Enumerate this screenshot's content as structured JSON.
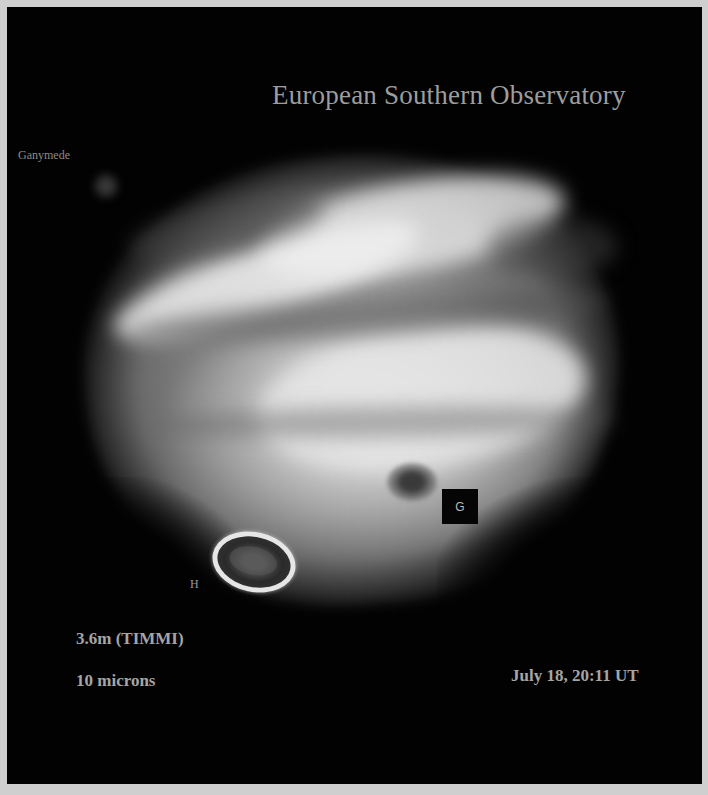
{
  "image": {
    "title": "European Southern Observatory",
    "subject": "Jupiter (infrared)",
    "labels": {
      "moon": "Ganymede",
      "impact_g": "G",
      "impact_h": "H"
    },
    "instrument": "3.6m (TIMMI)",
    "wavelength": "10 microns",
    "timestamp": "July 18, 20:11 UT"
  },
  "colors": {
    "frame_border": "#cfcfcf",
    "background": "#020202",
    "text": "#a3a3a3"
  }
}
